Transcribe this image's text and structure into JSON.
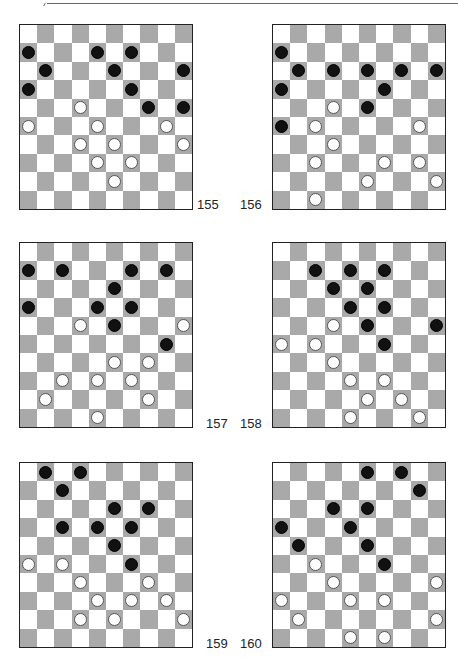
{
  "page": {
    "diagrams": [
      {
        "number": "155",
        "black": [
          [
            1,
            0
          ],
          [
            1,
            4
          ],
          [
            1,
            6
          ],
          [
            2,
            1
          ],
          [
            2,
            5
          ],
          [
            2,
            9
          ],
          [
            3,
            0
          ],
          [
            3,
            6
          ],
          [
            4,
            7
          ],
          [
            4,
            9
          ]
        ],
        "white": [
          [
            4,
            3
          ],
          [
            5,
            0
          ],
          [
            5,
            4
          ],
          [
            5,
            8
          ],
          [
            6,
            3
          ],
          [
            6,
            5
          ],
          [
            6,
            9
          ],
          [
            7,
            4
          ],
          [
            7,
            6
          ],
          [
            8,
            5
          ]
        ]
      },
      {
        "number": "156",
        "black": [
          [
            1,
            0
          ],
          [
            2,
            1
          ],
          [
            2,
            3
          ],
          [
            2,
            5
          ],
          [
            2,
            7
          ],
          [
            2,
            9
          ],
          [
            3,
            0
          ],
          [
            3,
            6
          ],
          [
            4,
            5
          ],
          [
            5,
            0
          ]
        ],
        "white": [
          [
            4,
            3
          ],
          [
            5,
            2
          ],
          [
            5,
            8
          ],
          [
            6,
            3
          ],
          [
            7,
            2
          ],
          [
            7,
            6
          ],
          [
            7,
            8
          ],
          [
            8,
            5
          ],
          [
            8,
            9
          ],
          [
            9,
            2
          ]
        ]
      },
      {
        "number": "157",
        "black": [
          [
            1,
            0
          ],
          [
            1,
            2
          ],
          [
            1,
            6
          ],
          [
            1,
            8
          ],
          [
            2,
            5
          ],
          [
            3,
            0
          ],
          [
            3,
            4
          ],
          [
            3,
            6
          ],
          [
            4,
            5
          ],
          [
            5,
            8
          ]
        ],
        "white": [
          [
            4,
            3
          ],
          [
            4,
            9
          ],
          [
            6,
            5
          ],
          [
            6,
            7
          ],
          [
            7,
            2
          ],
          [
            7,
            4
          ],
          [
            7,
            6
          ],
          [
            8,
            1
          ],
          [
            8,
            7
          ],
          [
            9,
            4
          ]
        ]
      },
      {
        "number": "158",
        "black": [
          [
            1,
            2
          ],
          [
            1,
            4
          ],
          [
            1,
            6
          ],
          [
            2,
            3
          ],
          [
            2,
            5
          ],
          [
            3,
            4
          ],
          [
            3,
            6
          ],
          [
            4,
            5
          ],
          [
            4,
            9
          ],
          [
            5,
            6
          ]
        ],
        "white": [
          [
            4,
            3
          ],
          [
            5,
            0
          ],
          [
            5,
            2
          ],
          [
            6,
            3
          ],
          [
            7,
            4
          ],
          [
            7,
            6
          ],
          [
            8,
            5
          ],
          [
            8,
            7
          ],
          [
            9,
            4
          ],
          [
            9,
            8
          ]
        ]
      },
      {
        "number": "159",
        "black": [
          [
            0,
            1
          ],
          [
            0,
            3
          ],
          [
            1,
            2
          ],
          [
            2,
            5
          ],
          [
            2,
            7
          ],
          [
            3,
            2
          ],
          [
            3,
            4
          ],
          [
            3,
            6
          ],
          [
            4,
            5
          ],
          [
            5,
            6
          ]
        ],
        "white": [
          [
            5,
            0
          ],
          [
            5,
            2
          ],
          [
            6,
            3
          ],
          [
            6,
            7
          ],
          [
            7,
            4
          ],
          [
            7,
            6
          ],
          [
            7,
            8
          ],
          [
            8,
            3
          ],
          [
            8,
            5
          ],
          [
            8,
            9
          ]
        ]
      },
      {
        "number": "160",
        "black": [
          [
            0,
            5
          ],
          [
            0,
            7
          ],
          [
            1,
            8
          ],
          [
            2,
            3
          ],
          [
            2,
            5
          ],
          [
            3,
            0
          ],
          [
            3,
            4
          ],
          [
            4,
            1
          ],
          [
            4,
            5
          ],
          [
            5,
            6
          ]
        ],
        "white": [
          [
            5,
            2
          ],
          [
            6,
            3
          ],
          [
            6,
            9
          ],
          [
            7,
            0
          ],
          [
            7,
            4
          ],
          [
            7,
            6
          ],
          [
            8,
            1
          ],
          [
            8,
            9
          ],
          [
            9,
            4
          ],
          [
            9,
            6
          ]
        ]
      }
    ],
    "colors": {
      "dark_square": "#a9a9a9",
      "light_square": "#ffffff",
      "black_piece": "#111111",
      "white_piece": "#ffffff"
    }
  }
}
